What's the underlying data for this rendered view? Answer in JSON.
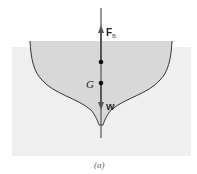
{
  "diagram": {
    "labels": {
      "buoyant_force": "F",
      "buoyant_force_sub": "B",
      "center_of_gravity": "G",
      "weight": "W",
      "caption": "(a)"
    },
    "colors": {
      "water": "#efefef",
      "hull": "#d8d8d8",
      "outline": "#333333",
      "line": "#555555"
    }
  }
}
